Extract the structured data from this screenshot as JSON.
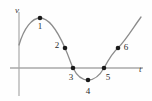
{
  "figure": {
    "background_color": "#fefefe",
    "axes": {
      "vertical_label": "v",
      "horizontal_label": "t",
      "axis_color": "#a9a9a9",
      "vertical_axis_x": 19,
      "horizontal_axis_y": 68
    },
    "curve": {
      "color": "#8c8c8c",
      "stroke_width": 1.3,
      "shape": "sine-like velocity curve: rises to a peak, falls through zero to a trough, then rises again"
    },
    "point_color": "#1a1a1a",
    "point_radius": 2.3
  },
  "chart_data": {
    "type": "line",
    "title": "",
    "xlabel": "t",
    "ylabel": "v",
    "grid": false,
    "legend": null,
    "xlim": [
      0,
      152
    ],
    "ylim": [
      0,
      101
    ],
    "annotations": [
      "1",
      "2",
      "3",
      "4",
      "5",
      "6"
    ],
    "points": [
      {
        "label": "1",
        "px": 40,
        "py": 18,
        "label_px": 40,
        "label_py": 29,
        "description": "maximum of curve, positive v"
      },
      {
        "label": "2",
        "px": 65,
        "py": 48,
        "label_px": 57,
        "label_py": 48,
        "description": "descending branch, positive v"
      },
      {
        "label": "3",
        "px": 73,
        "py": 68,
        "label_px": 71,
        "label_py": 80,
        "description": "first zero crossing on t-axis"
      },
      {
        "label": "4",
        "px": 88,
        "py": 80,
        "label_px": 88,
        "label_py": 94,
        "description": "minimum of curve, negative v"
      },
      {
        "label": "5",
        "px": 104,
        "py": 68,
        "label_px": 108,
        "label_py": 80,
        "description": "second zero crossing on t-axis"
      },
      {
        "label": "6",
        "px": 118,
        "py": 48,
        "label_px": 126,
        "label_py": 50,
        "description": "ascending branch, positive v"
      }
    ],
    "curve_path": "M 19 45 C 24 28, 32 18, 40 18 C 49 18, 58 32, 65 48 C 69 57, 71 64, 73 68 C 77 76, 83 80, 88 80 C 94 80, 100 75, 104 68 C 110 57, 113 52, 118 48 C 126 40, 133 28, 141 17"
  }
}
